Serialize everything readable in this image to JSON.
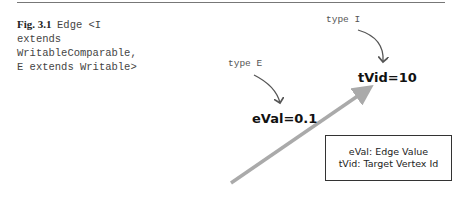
{
  "figure": {
    "label": "Fig. 3.1",
    "caption_lines": [
      "Edge <I",
      "extends",
      "WritableComparable,",
      "E extends Writable>"
    ]
  },
  "diagram": {
    "type_i_label": "type I",
    "type_e_label": "type E",
    "target_value": "tVid=10",
    "edge_value": "eVal=0.1",
    "legend": {
      "line1": "eVal: Edge Value",
      "line2": "tVid: Target Vertex Id"
    }
  }
}
